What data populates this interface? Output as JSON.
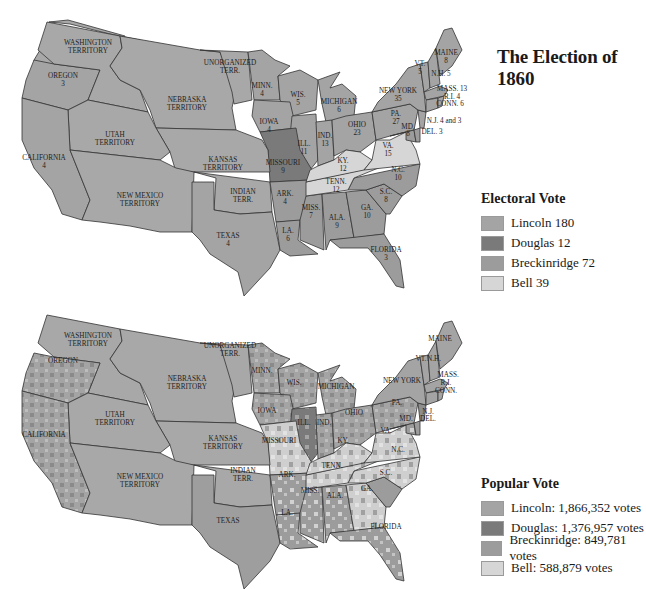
{
  "title": "The Election of 1860",
  "colors": {
    "lincoln": "#a4a4a4",
    "douglas": "#7a7a7a",
    "breckinridge": "#9c9c9c",
    "bell": "#d6d6d6",
    "territory": "#a8a8a8"
  },
  "electoral_legend": {
    "heading": "Electoral Vote",
    "items": [
      {
        "label": "Lincoln 180",
        "color": "#a4a4a4"
      },
      {
        "label": "Douglas 12",
        "color": "#7a7a7a"
      },
      {
        "label": "Breckinridge 72",
        "color": "#9c9c9c"
      },
      {
        "label": "Bell 39",
        "color": "#d6d6d6"
      }
    ]
  },
  "popular_legend": {
    "heading": "Popular Vote",
    "items": [
      {
        "label": "Lincoln: 1,866,352 votes",
        "color": "#a4a4a4"
      },
      {
        "label": "Douglas: 1,376,957 votes",
        "color": "#7a7a7a"
      },
      {
        "label": "Breckinridge: 849,781 votes",
        "color": "#9c9c9c"
      },
      {
        "label": "Bell: 588,879 votes",
        "color": "#d6d6d6"
      }
    ]
  },
  "electoral_map": {
    "labels": {
      "washington": [
        "WASHINGTON",
        "TERRITORY"
      ],
      "oregon": [
        "OREGON",
        "3"
      ],
      "unorganized": [
        "UNORGANIZED",
        "TERR."
      ],
      "nebraska": [
        "NEBRASKA",
        "TERRITORY"
      ],
      "utah": [
        "UTAH",
        "TERRITORY"
      ],
      "california": [
        "CALIFORNIA",
        "4"
      ],
      "kansas": [
        "KANSAS",
        "TERRITORY"
      ],
      "new_mexico": [
        "NEW MEXICO",
        "TERRITORY"
      ],
      "indian": [
        "INDIAN",
        "TERR."
      ],
      "texas": [
        "TEXAS",
        "4"
      ],
      "minn": [
        "MINN.",
        "4"
      ],
      "wis": [
        "WIS.",
        "5"
      ],
      "iowa": [
        "IOWA",
        "4"
      ],
      "michigan": [
        "MICHIGAN",
        "6"
      ],
      "ill": [
        "ILL.",
        "11"
      ],
      "ind": [
        "IND.",
        "13"
      ],
      "ohio": [
        "OHIO",
        "23"
      ],
      "missouri": [
        "MISSOURI",
        "9"
      ],
      "ky": [
        "KY.",
        "12"
      ],
      "va": [
        "VA.",
        "15"
      ],
      "tenn": [
        "TENN.",
        "12"
      ],
      "nc": [
        "N.C.",
        "10"
      ],
      "sc": [
        "S.C.",
        "8"
      ],
      "ga": [
        "GA.",
        "10"
      ],
      "ala": [
        "ALA.",
        "9"
      ],
      "miss": [
        "MISS.",
        "7"
      ],
      "la": [
        "LA.",
        "6"
      ],
      "ark": [
        "ARK.",
        "4"
      ],
      "florida": [
        "FLORIDA",
        "3"
      ],
      "pa": [
        "PA.",
        "27"
      ],
      "new_york": [
        "NEW YORK",
        "35"
      ],
      "maine": [
        "MAINE",
        "8"
      ],
      "vt": [
        "VT.",
        "5"
      ],
      "nh": "N.H. 5",
      "mass": "MASS. 13",
      "ri": "R.I. 4",
      "conn": "CONN. 6",
      "nj": "N.J. 4 and 3",
      "md": [
        "MD.",
        "8"
      ],
      "del": "DEL. 3"
    }
  },
  "popular_map": {
    "labels": {
      "washington": [
        "WASHINGTON",
        "TERRITORY"
      ],
      "oregon": "OREGON",
      "unorganized": [
        "UNORGANIZED",
        "TERR."
      ],
      "nebraska": [
        "NEBRASKA",
        "TERRITORY"
      ],
      "utah": [
        "UTAH",
        "TERRITORY"
      ],
      "california": "CALIFORNIA",
      "kansas": [
        "KANSAS",
        "TERRITORY"
      ],
      "new_mexico": [
        "NEW MEXICO",
        "TERRITORY"
      ],
      "indian": [
        "INDIAN",
        "TERR."
      ],
      "texas": "TEXAS",
      "minn": "MINN.",
      "wis": "WIS.",
      "iowa": "IOWA",
      "michigan": "MICHIGAN",
      "ill": "ILL.",
      "ind": "IND.",
      "ohio": "OHIO",
      "missouri": "MISSOURI",
      "ky": "KY.",
      "va": "VA.",
      "tenn": "TENN.",
      "nc": "N.C.",
      "sc": "S.C.",
      "ga": "GA.",
      "ala": "ALA.",
      "miss": "MISS.",
      "la": "LA.",
      "ark": "ARK.",
      "florida": "FLORIDA",
      "pa": "PA.",
      "new_york": "NEW YORK",
      "maine": "MAINE",
      "vt": "VT.",
      "nh": "N.H.",
      "mass": "MASS.",
      "ri": "R.I.",
      "conn": "CONN.",
      "nj": "N.J.",
      "md": "MD.",
      "del": "DEL."
    }
  }
}
